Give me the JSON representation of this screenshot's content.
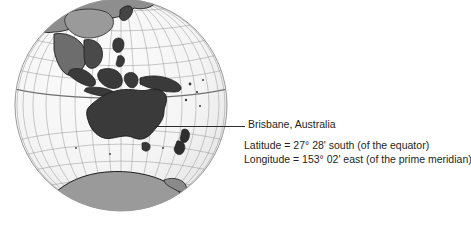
{
  "figure": {
    "type": "orthographic-globe-map",
    "projection_center_label": "Australia / Oceania",
    "colors": {
      "background": "#ffffff",
      "ocean": "#f4f4f4",
      "graticule": "#8d8d8d",
      "equator": "#6e6e6e",
      "globe_outline": "#9a9a9a",
      "land_dark": "#3a3a3a",
      "land_mid": "#8e8e8e",
      "land_light": "#b5b5b5",
      "coastline": "#1d1d1d",
      "leader_line": "#2b2b2b",
      "text": "#231f20"
    }
  },
  "callout": {
    "leader_line_name": "leader-line",
    "place": "Brisbane, Australia",
    "coordinates": [
      "Latitude = 27° 28' south (of the equator)",
      "Longitude = 153° 02' east (of the prime meridian)"
    ]
  }
}
